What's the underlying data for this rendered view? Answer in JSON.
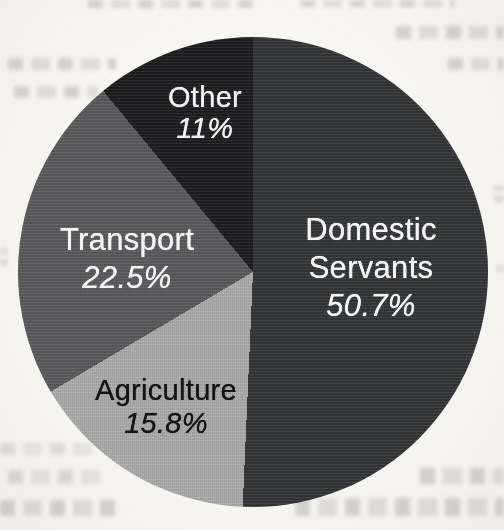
{
  "page": {
    "background_color": "#f5f4f0"
  },
  "chart_data": {
    "type": "pie",
    "direction": "clockwise",
    "start_angle_deg": 0,
    "legend_position": "none",
    "labels_on_slices": true,
    "slices": [
      {
        "label": "Domestic Servants",
        "value": 50.7,
        "display": "50.7%",
        "color": "#333436",
        "text_color": "#f4f4f4"
      },
      {
        "label": "Agriculture",
        "value": 15.8,
        "display": "15.8%",
        "color": "#a9a9a9",
        "text_color": "#151515"
      },
      {
        "label": "Transport",
        "value": 22.5,
        "display": "22.5%",
        "color": "#59595b",
        "text_color": "#f4f4f4"
      },
      {
        "label": "Other",
        "value": 11.0,
        "display": "11%",
        "color": "#1d1d1f",
        "text_color": "#f0f0f0"
      }
    ]
  }
}
